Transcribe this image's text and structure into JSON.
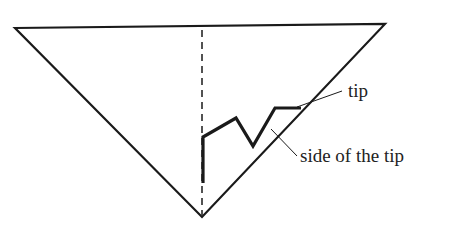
{
  "diagram": {
    "labels": {
      "tip": "tip",
      "side_of_tip": "side of the tip"
    },
    "colors": {
      "line": "#1a1a1a",
      "background": "#ffffff"
    }
  }
}
